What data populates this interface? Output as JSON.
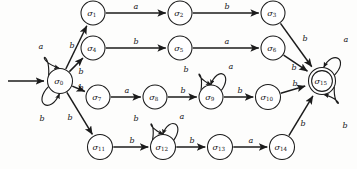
{
  "figure": {
    "name": "finite-state-automaton",
    "alphabet": [
      "a",
      "b"
    ],
    "start_state": "sigma_0",
    "accepting_states": [
      "sigma_15"
    ]
  },
  "nodes": [
    {
      "id": "sigma_0",
      "label": "σ",
      "sub": "0",
      "x": 60,
      "y": 81,
      "r": 12.5,
      "accepting": false,
      "start": true
    },
    {
      "id": "sigma_1",
      "label": "σ",
      "sub": "1",
      "x": 93,
      "y": 13,
      "r": 12.0,
      "accepting": false,
      "start": false
    },
    {
      "id": "sigma_2",
      "label": "σ",
      "sub": "2",
      "x": 180,
      "y": 13,
      "r": 12.0,
      "accepting": false,
      "start": false
    },
    {
      "id": "sigma_3",
      "label": "σ",
      "sub": "3",
      "x": 273,
      "y": 13,
      "r": 12.0,
      "accepting": false,
      "start": false
    },
    {
      "id": "sigma_4",
      "label": "σ",
      "sub": "4",
      "x": 93,
      "y": 48,
      "r": 12.0,
      "accepting": false,
      "start": false
    },
    {
      "id": "sigma_5",
      "label": "σ",
      "sub": "5",
      "x": 180,
      "y": 48,
      "r": 12.0,
      "accepting": false,
      "start": false
    },
    {
      "id": "sigma_6",
      "label": "σ",
      "sub": "6",
      "x": 273,
      "y": 48,
      "r": 12.0,
      "accepting": false,
      "start": false
    },
    {
      "id": "sigma_7",
      "label": "σ",
      "sub": "7",
      "x": 98,
      "y": 97,
      "r": 12.0,
      "accepting": false,
      "start": false
    },
    {
      "id": "sigma_8",
      "label": "σ",
      "sub": "8",
      "x": 155,
      "y": 97,
      "r": 12.0,
      "accepting": false,
      "start": false
    },
    {
      "id": "sigma_9",
      "label": "σ",
      "sub": "9",
      "x": 211,
      "y": 97,
      "r": 12.0,
      "accepting": false,
      "start": false
    },
    {
      "id": "sigma_10",
      "label": "σ",
      "sub": "10",
      "x": 268,
      "y": 97,
      "r": 12.5,
      "accepting": false,
      "start": false
    },
    {
      "id": "sigma_11",
      "label": "σ",
      "sub": "11",
      "x": 100,
      "y": 147,
      "r": 12.5,
      "accepting": false,
      "start": false
    },
    {
      "id": "sigma_12",
      "label": "σ",
      "sub": "12",
      "x": 163,
      "y": 147,
      "r": 12.5,
      "accepting": false,
      "start": false
    },
    {
      "id": "sigma_13",
      "label": "σ",
      "sub": "13",
      "x": 220,
      "y": 147,
      "r": 12.5,
      "accepting": false,
      "start": false
    },
    {
      "id": "sigma_14",
      "label": "σ",
      "sub": "14",
      "x": 282,
      "y": 147,
      "r": 12.5,
      "accepting": false,
      "start": false
    },
    {
      "id": "sigma_15",
      "label": "σ",
      "sub": "15",
      "x": 322,
      "y": 81,
      "r": 13.5,
      "accepting": true,
      "start": false
    }
  ],
  "transitions": [
    {
      "from": "sigma_0",
      "to": "sigma_1",
      "symbol": "b",
      "label_x": 72,
      "label_y": 46
    },
    {
      "from": "sigma_0",
      "to": "sigma_4",
      "symbol": "b",
      "label_x": 81,
      "label_y": 72
    },
    {
      "from": "sigma_0",
      "to": "sigma_7",
      "symbol": "b",
      "label_x": 81,
      "label_y": 88
    },
    {
      "from": "sigma_0",
      "to": "sigma_11",
      "symbol": "b",
      "label_x": 70,
      "label_y": 118
    },
    {
      "from": "sigma_1",
      "to": "sigma_2",
      "symbol": "a",
      "label_x": 136,
      "label_y": 7
    },
    {
      "from": "sigma_2",
      "to": "sigma_3",
      "symbol": "b",
      "label_x": 227,
      "label_y": 7
    },
    {
      "from": "sigma_3",
      "to": "sigma_15",
      "symbol": "b",
      "label_x": 305,
      "label_y": 39
    },
    {
      "from": "sigma_4",
      "to": "sigma_5",
      "symbol": "b",
      "label_x": 136,
      "label_y": 42
    },
    {
      "from": "sigma_5",
      "to": "sigma_6",
      "symbol": "a",
      "label_x": 227,
      "label_y": 42
    },
    {
      "from": "sigma_6",
      "to": "sigma_15",
      "symbol": "b",
      "label_x": 294,
      "label_y": 68
    },
    {
      "from": "sigma_7",
      "to": "sigma_8",
      "symbol": "a",
      "label_x": 127,
      "label_y": 91
    },
    {
      "from": "sigma_8",
      "to": "sigma_9",
      "symbol": "b",
      "label_x": 183,
      "label_y": 91
    },
    {
      "from": "sigma_9",
      "to": "sigma_10",
      "symbol": "b",
      "label_x": 240,
      "label_y": 91
    },
    {
      "from": "sigma_10",
      "to": "sigma_15",
      "symbol": "b",
      "label_x": 295,
      "label_y": 84
    },
    {
      "from": "sigma_11",
      "to": "sigma_12",
      "symbol": "b",
      "label_x": 132,
      "label_y": 141
    },
    {
      "from": "sigma_12",
      "to": "sigma_13",
      "symbol": "b",
      "label_x": 192,
      "label_y": 141
    },
    {
      "from": "sigma_13",
      "to": "sigma_14",
      "symbol": "a",
      "label_x": 251,
      "label_y": 141
    },
    {
      "from": "sigma_14",
      "to": "sigma_15",
      "symbol": "b",
      "label_x": 303,
      "label_y": 124
    }
  ],
  "self_loops": [
    {
      "state": "sigma_0",
      "symbol": "a",
      "label_x": 41,
      "label_y": 47
    },
    {
      "state": "sigma_0",
      "symbol": "b",
      "label_x": 42,
      "label_y": 119
    },
    {
      "state": "sigma_9",
      "symbol": "b",
      "label_x": 186,
      "label_y": 70
    },
    {
      "state": "sigma_9",
      "symbol": "a",
      "label_x": 231,
      "label_y": 67
    },
    {
      "state": "sigma_12",
      "symbol": "b",
      "label_x": 136,
      "label_y": 119
    },
    {
      "state": "sigma_12",
      "symbol": "a",
      "label_x": 182,
      "label_y": 117
    },
    {
      "state": "sigma_15",
      "symbol": "a",
      "label_x": 346,
      "label_y": 40
    },
    {
      "state": "sigma_15",
      "symbol": "b",
      "label_x": 345,
      "label_y": 126
    }
  ],
  "colors": {
    "stroke": "#1b1b1b",
    "node_fill": "#ffffff",
    "background": "#fdfdfc",
    "text": "#131313"
  }
}
